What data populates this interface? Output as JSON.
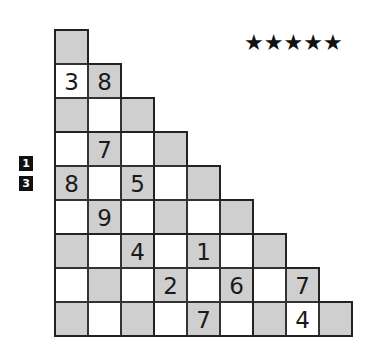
{
  "puzzle": {
    "difficulty_label": "★★★★★",
    "difficulty_stars": 5,
    "side_clues": [
      "1",
      "3"
    ],
    "colors": {
      "shaded": "#cfcfcf",
      "unshaded": "#ffffff",
      "line": "#222222"
    },
    "rows": [
      [
        {
          "v": "",
          "s": 1
        }
      ],
      [
        {
          "v": "3",
          "s": 0
        },
        {
          "v": "8",
          "s": 1
        }
      ],
      [
        {
          "v": "",
          "s": 1
        },
        {
          "v": "",
          "s": 0
        },
        {
          "v": "",
          "s": 1
        }
      ],
      [
        {
          "v": "",
          "s": 0
        },
        {
          "v": "7",
          "s": 1
        },
        {
          "v": "",
          "s": 0
        },
        {
          "v": "",
          "s": 1
        }
      ],
      [
        {
          "v": "8",
          "s": 1
        },
        {
          "v": "",
          "s": 0
        },
        {
          "v": "5",
          "s": 1
        },
        {
          "v": "",
          "s": 0
        },
        {
          "v": "",
          "s": 1
        }
      ],
      [
        {
          "v": "",
          "s": 0
        },
        {
          "v": "9",
          "s": 1
        },
        {
          "v": "",
          "s": 0
        },
        {
          "v": "",
          "s": 1
        },
        {
          "v": "",
          "s": 0
        },
        {
          "v": "",
          "s": 1
        }
      ],
      [
        {
          "v": "",
          "s": 1
        },
        {
          "v": "",
          "s": 0
        },
        {
          "v": "4",
          "s": 1
        },
        {
          "v": "",
          "s": 0
        },
        {
          "v": "1",
          "s": 1
        },
        {
          "v": "",
          "s": 0
        },
        {
          "v": "",
          "s": 1
        }
      ],
      [
        {
          "v": "",
          "s": 0
        },
        {
          "v": "",
          "s": 1
        },
        {
          "v": "",
          "s": 0
        },
        {
          "v": "2",
          "s": 1
        },
        {
          "v": "",
          "s": 0
        },
        {
          "v": "6",
          "s": 1
        },
        {
          "v": "",
          "s": 0
        },
        {
          "v": "7",
          "s": 1
        }
      ],
      [
        {
          "v": "",
          "s": 1
        },
        {
          "v": "",
          "s": 0
        },
        {
          "v": "",
          "s": 1
        },
        {
          "v": "",
          "s": 0
        },
        {
          "v": "7",
          "s": 1
        },
        {
          "v": "",
          "s": 0
        },
        {
          "v": "",
          "s": 1
        },
        {
          "v": "4",
          "s": 0
        },
        {
          "v": "",
          "s": 1
        }
      ]
    ]
  }
}
